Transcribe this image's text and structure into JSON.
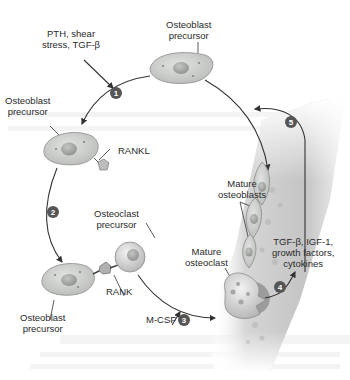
{
  "figure": {
    "labels": {
      "stimuli": "PTH, shear\nstress, TGF-β",
      "stimuli_line1": "PTH, shear",
      "stimuli_line2": "stress, TGF-β",
      "top_precursor_line1": "Osteoblast",
      "top_precursor_line2": "precursor",
      "left_precursor_line1": "Osteoblast",
      "left_precursor_line2": "precursor",
      "rankl": "RANKL",
      "osteoclast_precursor_line1": "Osteoclast",
      "osteoclast_precursor_line2": "precursor",
      "rank": "RANK",
      "bottom_precursor_line1": "Osteoblast",
      "bottom_precursor_line2": "precursor",
      "mcsf": "M-CSF",
      "mature_osteoblasts_line1": "Mature",
      "mature_osteoblasts_line2": "osteoblasts",
      "mature_osteoclast_line1": "Mature",
      "mature_osteoclast_line2": "osteoclast",
      "factors_line1": "TGF-β, IGF-1,",
      "factors_line2": "growth factors,",
      "factors_line3": "cytokines"
    },
    "steps": [
      {
        "number": "1"
      },
      {
        "number": "2"
      },
      {
        "number": "3"
      },
      {
        "number": "4"
      },
      {
        "number": "5"
      }
    ],
    "colors": {
      "cell_fill": "#cdd0cc",
      "cell_stroke": "#8a8d89",
      "nucleus": "#a7aaa6",
      "arrow": "#333333",
      "step_badge": "#555555",
      "bone": "#c9c9c9",
      "bone_dark": "#a9a9a9"
    }
  }
}
